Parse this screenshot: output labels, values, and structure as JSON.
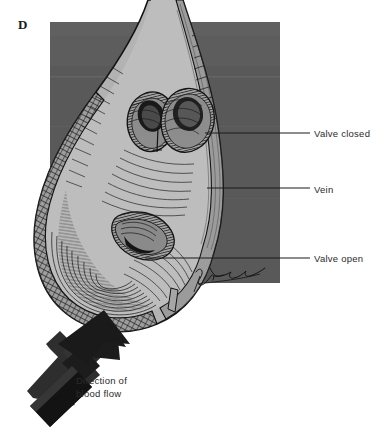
{
  "figure": {
    "panel_letter": "D",
    "background_color": "#ffffff",
    "panel_color": "#595959",
    "panel_color_light": "#6a6a6a",
    "vessel_fill_color": "#b3b3b3",
    "vessel_shadow_color": "#8f8f8f",
    "ink_color": "#1a1a1a",
    "arrow_color": "#1c1c1c",
    "label_color": "#2b2b2b"
  },
  "labels": [
    {
      "id": "valve-closed",
      "text": "Valve closed"
    },
    {
      "id": "vein",
      "text": "Vein"
    },
    {
      "id": "valve-open",
      "text": "Valve open"
    }
  ],
  "caption": {
    "line1": "Direction of",
    "line2": "blood flow"
  },
  "signature": {
    "text": "artist-signature",
    "visible": true
  }
}
